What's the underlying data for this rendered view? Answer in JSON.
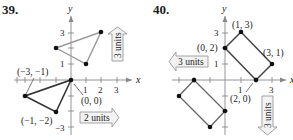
{
  "figures": [
    {
      "number": "39.",
      "axes": {
        "x_label": "x",
        "y_label": "y",
        "x_ticks": [
          "1",
          "2",
          "3"
        ],
        "y_ticks": [
          "3",
          "1",
          "−3"
        ]
      },
      "original_vertices": [
        {
          "label": "(−3, −1)",
          "x": -3,
          "y": -1
        },
        {
          "label": "(−1, −2)",
          "x": -1,
          "y": -2
        },
        {
          "label": "(0, 0)",
          "x": 0,
          "y": 0
        }
      ],
      "translated_vertices": [
        {
          "x": -1,
          "y": 2
        },
        {
          "x": 1,
          "y": 1
        },
        {
          "x": 2,
          "y": 3
        }
      ],
      "arrows": [
        {
          "label": "2 units",
          "direction": "right"
        },
        {
          "label": "3 units",
          "direction": "up"
        }
      ]
    },
    {
      "number": "40.",
      "axes": {
        "x_label": "x",
        "y_label": "y",
        "x_ticks": [
          "1",
          "3"
        ],
        "y_ticks": [
          "3",
          "1"
        ]
      },
      "original_vertices": [
        {
          "label": "(0, 2)",
          "x": 0,
          "y": 2
        },
        {
          "label": "(1, 3)",
          "x": 1,
          "y": 3
        },
        {
          "label": "(3, 1)",
          "x": 3,
          "y": 1
        },
        {
          "label": "(2, 0)",
          "x": 2,
          "y": 0
        }
      ],
      "translated_vertices": [
        {
          "x": -3,
          "y": -1
        },
        {
          "x": -2,
          "y": 0
        },
        {
          "x": 0,
          "y": -2
        },
        {
          "x": -1,
          "y": -3
        }
      ],
      "arrows": [
        {
          "label": "3 units",
          "direction": "left"
        },
        {
          "label": "3 units",
          "direction": "down"
        }
      ]
    }
  ]
}
